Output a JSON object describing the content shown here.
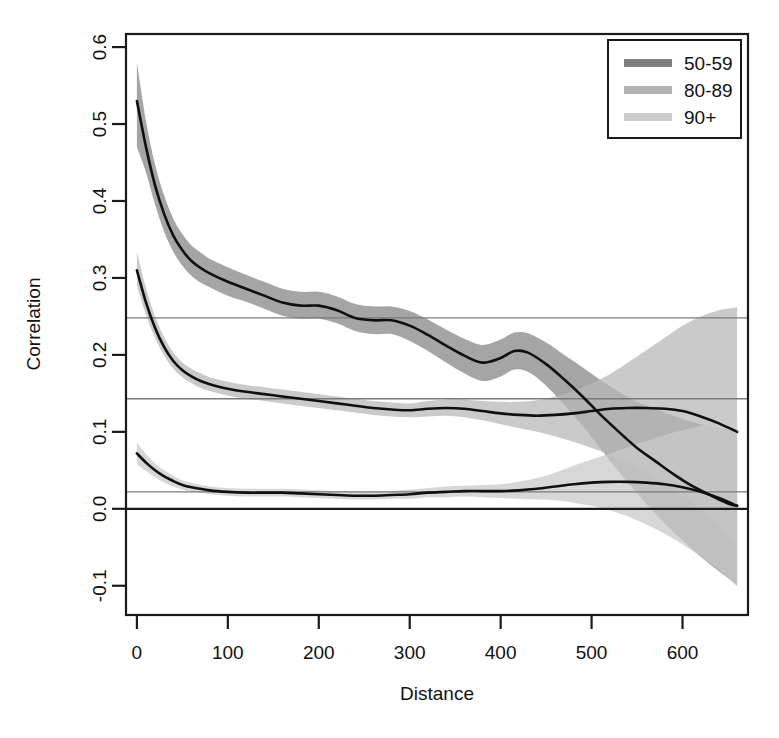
{
  "chart_data": {
    "type": "line",
    "title": "",
    "xlabel": "Distance",
    "ylabel": "Correlation",
    "xlim": [
      -12,
      672
    ],
    "ylim": [
      -0.138,
      0.617
    ],
    "xticks": [
      0,
      100,
      200,
      300,
      400,
      500,
      600
    ],
    "xticklabels": [
      "0",
      "100",
      "200",
      "300",
      "400",
      "500",
      "600"
    ],
    "yticks": [
      -0.1,
      0.0,
      0.1,
      0.2,
      0.3,
      0.4,
      0.5,
      0.6
    ],
    "yticklabels": [
      "-0.1",
      "0.0",
      "0.1",
      "0.2",
      "0.3",
      "0.4",
      "0.5",
      "0.6"
    ],
    "grid": false,
    "legend_position": "top-right",
    "legend_entries": [
      "50-59",
      "80-89",
      "90+"
    ],
    "reference_lines": [
      {
        "y": 0.248,
        "style": "thin-gray",
        "series": "50-59"
      },
      {
        "y": 0.143,
        "style": "thin-gray",
        "series": "80-89"
      },
      {
        "y": 0.022,
        "style": "thin-gray",
        "series": "90+"
      },
      {
        "y": 0.0,
        "style": "thick-black",
        "series": "zero"
      }
    ],
    "series": [
      {
        "name": "50-59",
        "color": "#808080",
        "band_color": "#878787",
        "x": [
          0,
          10,
          20,
          30,
          40,
          50,
          60,
          70,
          80,
          100,
          120,
          140,
          160,
          180,
          200,
          220,
          240,
          260,
          280,
          300,
          320,
          340,
          360,
          380,
          400,
          415,
          430,
          450,
          470,
          490,
          510,
          530,
          550,
          570,
          590,
          610,
          630,
          650,
          660
        ],
        "values": [
          0.53,
          0.47,
          0.42,
          0.383,
          0.355,
          0.336,
          0.322,
          0.313,
          0.306,
          0.295,
          0.286,
          0.277,
          0.268,
          0.264,
          0.264,
          0.258,
          0.248,
          0.245,
          0.245,
          0.238,
          0.226,
          0.212,
          0.199,
          0.19,
          0.196,
          0.205,
          0.203,
          0.188,
          0.168,
          0.146,
          0.122,
          0.1,
          0.079,
          0.062,
          0.045,
          0.03,
          0.018,
          0.007,
          0.004
        ],
        "band_lower": [
          0.47,
          0.437,
          0.395,
          0.36,
          0.334,
          0.316,
          0.303,
          0.294,
          0.288,
          0.277,
          0.269,
          0.26,
          0.251,
          0.247,
          0.247,
          0.241,
          0.231,
          0.227,
          0.227,
          0.218,
          0.205,
          0.19,
          0.176,
          0.166,
          0.172,
          0.181,
          0.178,
          0.16,
          0.135,
          0.108,
          0.078,
          0.048,
          0.02,
          -0.006,
          -0.03,
          -0.052,
          -0.072,
          -0.09,
          -0.1
        ],
        "band_upper": [
          0.58,
          0.504,
          0.447,
          0.407,
          0.377,
          0.357,
          0.342,
          0.333,
          0.325,
          0.314,
          0.304,
          0.295,
          0.286,
          0.282,
          0.282,
          0.276,
          0.266,
          0.263,
          0.263,
          0.257,
          0.246,
          0.233,
          0.221,
          0.213,
          0.22,
          0.229,
          0.228,
          0.216,
          0.2,
          0.184,
          0.167,
          0.152,
          0.139,
          0.13,
          0.121,
          0.113,
          0.107,
          0.103,
          0.102
        ]
      },
      {
        "name": "80-89",
        "color": "#b3b3b3",
        "band_color": "#b8b8b8",
        "x": [
          0,
          10,
          20,
          30,
          40,
          50,
          60,
          70,
          80,
          100,
          120,
          140,
          160,
          180,
          200,
          220,
          240,
          260,
          280,
          300,
          320,
          340,
          360,
          380,
          400,
          420,
          440,
          460,
          480,
          500,
          520,
          540,
          560,
          580,
          600,
          620,
          640,
          660
        ],
        "values": [
          0.31,
          0.268,
          0.235,
          0.21,
          0.192,
          0.18,
          0.172,
          0.166,
          0.162,
          0.156,
          0.152,
          0.149,
          0.146,
          0.143,
          0.14,
          0.137,
          0.134,
          0.131,
          0.129,
          0.128,
          0.13,
          0.131,
          0.13,
          0.127,
          0.124,
          0.122,
          0.121,
          0.122,
          0.124,
          0.127,
          0.13,
          0.131,
          0.131,
          0.13,
          0.127,
          0.12,
          0.111,
          0.1
        ],
        "band_lower": [
          0.29,
          0.252,
          0.222,
          0.199,
          0.182,
          0.171,
          0.163,
          0.157,
          0.153,
          0.147,
          0.143,
          0.14,
          0.137,
          0.134,
          0.131,
          0.128,
          0.125,
          0.122,
          0.12,
          0.119,
          0.12,
          0.121,
          0.119,
          0.115,
          0.11,
          0.105,
          0.1,
          0.094,
          0.087,
          0.079,
          0.07,
          0.06,
          0.048,
          0.034,
          0.018,
          0.0,
          -0.022,
          -0.048
        ],
        "band_upper": [
          0.334,
          0.287,
          0.25,
          0.223,
          0.203,
          0.19,
          0.182,
          0.176,
          0.171,
          0.165,
          0.161,
          0.158,
          0.155,
          0.152,
          0.149,
          0.146,
          0.143,
          0.14,
          0.138,
          0.137,
          0.14,
          0.142,
          0.142,
          0.14,
          0.139,
          0.139,
          0.141,
          0.146,
          0.153,
          0.163,
          0.175,
          0.19,
          0.206,
          0.222,
          0.238,
          0.25,
          0.258,
          0.262
        ]
      },
      {
        "name": "90+",
        "color": "#cccccc",
        "band_color": "#c9c9c9",
        "x": [
          0,
          10,
          20,
          30,
          40,
          50,
          60,
          80,
          100,
          120,
          140,
          160,
          180,
          200,
          220,
          240,
          260,
          280,
          300,
          320,
          340,
          360,
          380,
          400,
          420,
          440,
          460,
          480,
          500,
          520,
          540,
          560,
          580,
          600,
          620,
          640,
          660
        ],
        "values": [
          0.072,
          0.06,
          0.05,
          0.042,
          0.036,
          0.031,
          0.028,
          0.024,
          0.022,
          0.021,
          0.021,
          0.021,
          0.02,
          0.019,
          0.018,
          0.017,
          0.017,
          0.018,
          0.019,
          0.021,
          0.022,
          0.023,
          0.023,
          0.023,
          0.024,
          0.026,
          0.029,
          0.032,
          0.034,
          0.035,
          0.035,
          0.034,
          0.032,
          0.028,
          0.022,
          0.014,
          0.004
        ],
        "band_lower": [
          0.058,
          0.049,
          0.041,
          0.034,
          0.029,
          0.025,
          0.022,
          0.019,
          0.017,
          0.016,
          0.016,
          0.016,
          0.015,
          0.014,
          0.013,
          0.012,
          0.012,
          0.013,
          0.013,
          0.015,
          0.015,
          0.016,
          0.015,
          0.014,
          0.013,
          0.012,
          0.011,
          0.008,
          0.004,
          -0.002,
          -0.01,
          -0.02,
          -0.032,
          -0.046,
          -0.062,
          -0.08,
          -0.1
        ],
        "band_upper": [
          0.086,
          0.071,
          0.059,
          0.05,
          0.043,
          0.037,
          0.034,
          0.029,
          0.027,
          0.026,
          0.026,
          0.026,
          0.025,
          0.024,
          0.023,
          0.022,
          0.022,
          0.023,
          0.025,
          0.027,
          0.029,
          0.03,
          0.031,
          0.032,
          0.035,
          0.04,
          0.047,
          0.056,
          0.064,
          0.072,
          0.08,
          0.088,
          0.096,
          0.102,
          0.108,
          0.112,
          0.115
        ]
      }
    ]
  },
  "axes": {
    "x_title": "Distance",
    "y_title": "Correlation"
  },
  "legend": {
    "items": [
      {
        "label": "50-59",
        "color": "#808080"
      },
      {
        "label": "80-89",
        "color": "#b3b3b3"
      },
      {
        "label": "90+",
        "color": "#cccccc"
      }
    ]
  }
}
